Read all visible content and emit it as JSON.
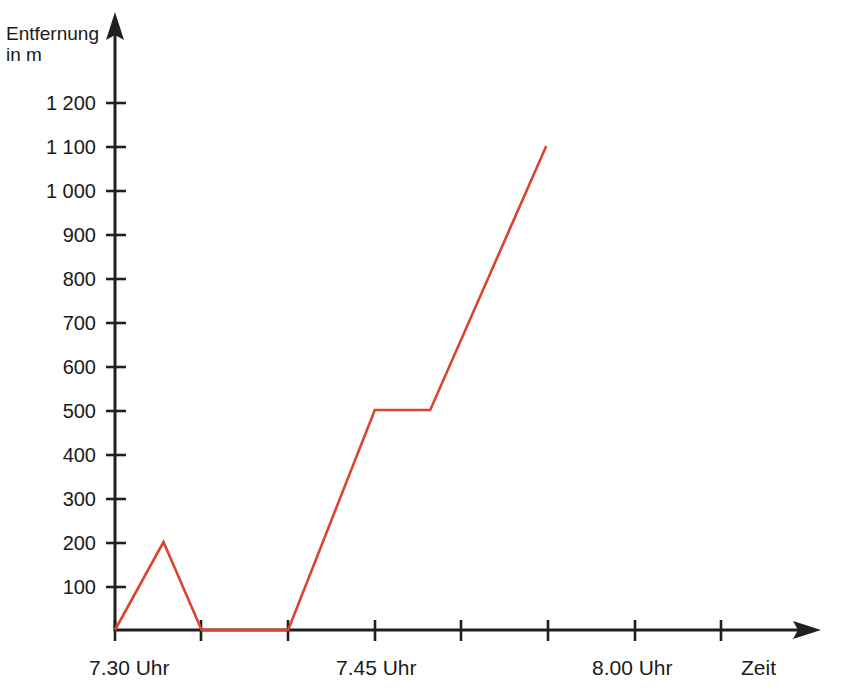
{
  "chart_data": {
    "type": "line",
    "title": "",
    "subtitle": "",
    "xlabel": "Zeit",
    "ylabel": "Entfernung in m",
    "ylabel_line1": "Entfernung",
    "ylabel_line2": "in m",
    "grid": false,
    "legend": "none",
    "line_color": "#d9452e",
    "axis_color": "#231f20",
    "background_color": "#ffffff",
    "ylim": [
      0,
      1250
    ],
    "ytick_values": [
      100,
      200,
      300,
      400,
      500,
      600,
      700,
      800,
      900,
      1000,
      1100,
      1200
    ],
    "ytick_labels": [
      "100",
      "200",
      "300",
      "400",
      "500",
      "600",
      "700",
      "800",
      "900",
      "1 000",
      "1 100",
      "1 200"
    ],
    "xlim_minutes": [
      0,
      30
    ],
    "xtick_minutes": [
      0,
      5,
      10,
      15,
      20,
      25,
      30,
      35
    ],
    "xtick_labels": [
      "7.30 Uhr",
      "",
      "",
      "7.45 Uhr",
      "",
      "",
      "8.00 Uhr",
      ""
    ],
    "xtick_labels_visible": [
      {
        "minutes": 0,
        "label": "7.30 Uhr"
      },
      {
        "minutes": 15,
        "label": "7.45 Uhr"
      },
      {
        "minutes": 30,
        "label": "8.00 Uhr"
      }
    ],
    "x_unit": "minutes after 7.30 Uhr",
    "y_unit": "m",
    "series": [
      {
        "name": "Entfernung",
        "color": "#d9452e",
        "points": [
          {
            "minutes": 0,
            "time": "7.30 Uhr",
            "distance": 0
          },
          {
            "minutes": 2.8,
            "time": "7.32.48",
            "distance": 200
          },
          {
            "minutes": 5,
            "time": "7.35 Uhr",
            "distance": 0
          },
          {
            "minutes": 10,
            "time": "7.40 Uhr",
            "distance": 0
          },
          {
            "minutes": 15,
            "time": "7.45 Uhr",
            "distance": 500
          },
          {
            "minutes": 18.2,
            "time": "7.48 Uhr",
            "distance": 500
          },
          {
            "minutes": 24.9,
            "time": "7.55 Uhr",
            "distance": 1100
          }
        ]
      }
    ]
  },
  "axes": {
    "y_arrow": "arrow-up",
    "x_arrow": "arrow-right",
    "x_axis_end_label": "Zeit"
  }
}
